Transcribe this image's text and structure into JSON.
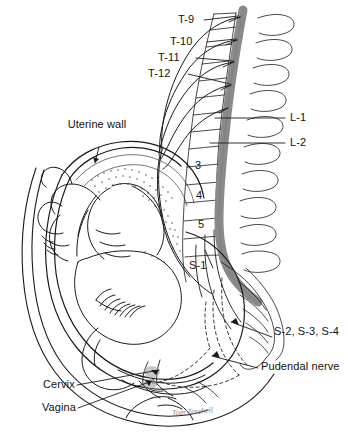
{
  "figure": {
    "background_color": "#ffffff",
    "ink_color": "#1a1a1a",
    "spinal_cord_color": "#8a8a8a",
    "signature": "Tom Terchell"
  },
  "labels": {
    "t9": "T-9",
    "t10": "T-10",
    "t11": "T-11",
    "t12": "T-12",
    "l1": "L-1",
    "l2": "L-2",
    "v3": "3",
    "v4": "4",
    "v5": "5",
    "s1": "S-1",
    "s234": "S-2, S-3, S-4",
    "pudendal": "Pudendal nerve",
    "uterine_wall": "Uterine wall",
    "cervix": "Cervix",
    "vagina": "Vagina"
  },
  "structures": {
    "spinal_cord": "spinal-cord",
    "vertebral_column": "vertebral-column",
    "sacrum": "sacrum",
    "uterus": "uterus",
    "fetus": "fetus",
    "placenta": "placenta",
    "bladder": "bladder",
    "pelvic_floor": "pelvic-floor",
    "pubic_bone": "pubic-bone",
    "abdominal_wall": "abdominal-wall",
    "sympathetic_nerves": "sympathetic-nerve-fibers",
    "sacral_nerves": "sacral-nerve-fibers"
  }
}
